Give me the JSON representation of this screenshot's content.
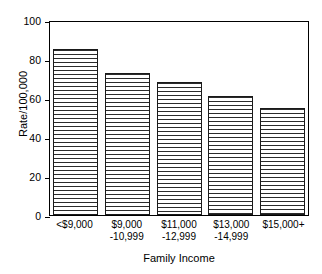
{
  "chart_data": {
    "type": "bar",
    "title": "",
    "xlabel": "Family Income",
    "ylabel": "Rate/100,000",
    "categories": [
      "<$9,000",
      "$9,000\n-10,999",
      "$11,000\n-12,999",
      "$13,000\n-14,999",
      "$15,000+"
    ],
    "category_lines": [
      {
        "line1": "<$9,000",
        "line2": ""
      },
      {
        "line1": "$9,000",
        "line2": "-10,999"
      },
      {
        "line1": "$11,000",
        "line2": "-12,999"
      },
      {
        "line1": "$13,000",
        "line2": "-14,999"
      },
      {
        "line1": "$15,000+",
        "line2": ""
      }
    ],
    "values": [
      85,
      73,
      68,
      61,
      55
    ],
    "ylim": [
      0,
      100
    ],
    "yticks": [
      0,
      20,
      40,
      60,
      80,
      100
    ],
    "ytick_labels": [
      "0",
      "20",
      "40",
      "60",
      "80",
      "100"
    ],
    "grid": false,
    "legend": null,
    "bar_fill": "horizontal-line-hatch",
    "bar_edge_color": "#1a1a1a",
    "background_color": "#ffffff"
  }
}
